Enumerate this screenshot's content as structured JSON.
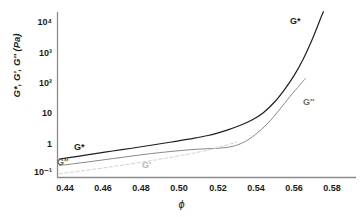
{
  "chart_data": {
    "type": "line",
    "title": "",
    "xlabel": "ϕ",
    "ylabel": "G*, G′, G″ (Pa)",
    "xlim": [
      0.4325,
      0.5875
    ],
    "ylim": [
      0.07,
      20000
    ],
    "yscale": "log",
    "xscale": "linear",
    "grid": false,
    "legend": "inline-annotations",
    "xticks": [
      "0.44",
      "0.46",
      "0.48",
      "0.50",
      "0.52",
      "0.54",
      "0.56",
      "0.58"
    ],
    "xtick_values": [
      0.44,
      0.46,
      0.48,
      0.5,
      0.52,
      0.54,
      0.56,
      0.58
    ],
    "yticks": [
      "10⁴",
      "10³",
      "10²",
      "10",
      "1",
      "10⁻¹"
    ],
    "ytick_values": [
      10000,
      1000,
      100,
      10,
      1,
      0.1
    ],
    "series": [
      {
        "name": "G*",
        "label": "G*",
        "color": "#1f1f1f",
        "style": "solid",
        "width": 1.2,
        "x": [
          0.437,
          0.445,
          0.455,
          0.465,
          0.475,
          0.485,
          0.495,
          0.505,
          0.515,
          0.525,
          0.532,
          0.538,
          0.544,
          0.55,
          0.555,
          0.56,
          0.565,
          0.57,
          0.574,
          0.5755
        ],
        "y": [
          0.27,
          0.32,
          0.4,
          0.5,
          0.62,
          0.78,
          0.98,
          1.25,
          1.65,
          2.5,
          3.6,
          5.4,
          9.5,
          22.0,
          55.0,
          160.0,
          600.0,
          3000.0,
          13000.0,
          22000.0
        ]
      },
      {
        "name": "G''",
        "label": "G″",
        "color": "#8a8a8a",
        "style": "solid",
        "width": 1.0,
        "x": [
          0.437,
          0.445,
          0.455,
          0.465,
          0.475,
          0.485,
          0.495,
          0.505,
          0.515,
          0.522,
          0.528,
          0.534,
          0.54,
          0.546,
          0.552,
          0.558,
          0.563,
          0.566
        ],
        "y": [
          0.165,
          0.19,
          0.23,
          0.28,
          0.34,
          0.41,
          0.48,
          0.55,
          0.6,
          0.63,
          0.72,
          1.0,
          1.8,
          4.0,
          11.0,
          33.0,
          78.0,
          130.0
        ]
      },
      {
        "name": "G'",
        "label": "G′",
        "color": "#cfcfcf",
        "style": "dashed",
        "width": 1.0,
        "x": [
          0.437,
          0.447,
          0.457,
          0.467,
          0.477,
          0.487,
          0.497,
          0.507,
          0.517,
          0.525,
          0.53
        ],
        "y": [
          0.088,
          0.105,
          0.128,
          0.158,
          0.198,
          0.25,
          0.32,
          0.42,
          0.58,
          0.8,
          0.98
        ]
      }
    ],
    "annotations": [
      {
        "text": "G*",
        "series": "G*",
        "x_px": 290,
        "y_px": 22,
        "color": "#1f1f1f"
      },
      {
        "text": "G″",
        "series": "G''",
        "x_px": 303,
        "y_px": 103,
        "color": "#6e6e6e"
      },
      {
        "text": "G*",
        "series": "G*",
        "x_px": 74,
        "y_px": 148,
        "color": "#1f1f1f"
      },
      {
        "text": "G″",
        "series": "G''",
        "x_px": 57,
        "y_px": 163,
        "color": "#5f5f5f"
      },
      {
        "text": "G′",
        "series": "G'",
        "x_px": 142,
        "y_px": 166,
        "color": "#bdbdbd"
      }
    ]
  },
  "axes": {
    "axis_color": "#8c8c8c",
    "background": "#ffffff"
  }
}
